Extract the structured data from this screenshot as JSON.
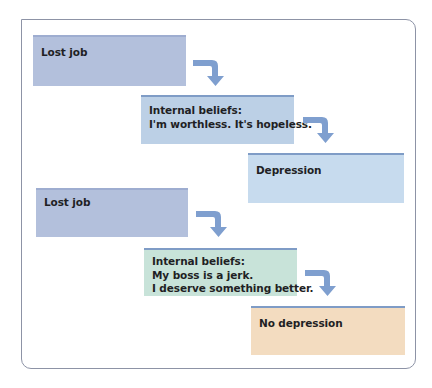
{
  "diagram": {
    "type": "flow",
    "colors": {
      "frame_border": "#8d93a6",
      "event_box": "#b3c0dc",
      "belief_negative_box": "#bcd0e6",
      "depression_box": "#c7dbee",
      "belief_positive_box": "#c8e3d9",
      "no_depression_box": "#f3dcc0",
      "arrow": "#7f9fcf"
    },
    "scenario_1": {
      "event": {
        "label": "Lost job"
      },
      "beliefs": {
        "heading": "Internal beliefs:",
        "lines": [
          "I'm worthless. It's hopeless."
        ]
      },
      "outcome": {
        "label": "Depression"
      }
    },
    "scenario_2": {
      "event": {
        "label": "Lost job"
      },
      "beliefs": {
        "heading": "Internal beliefs:",
        "lines": [
          "My boss is a jerk.",
          "I deserve something better."
        ]
      },
      "outcome": {
        "label": "No depression"
      }
    },
    "arrows": [
      {
        "from": "scenario_1.event",
        "to": "scenario_1.beliefs",
        "icon": "bent-arrow-down-right"
      },
      {
        "from": "scenario_1.beliefs",
        "to": "scenario_1.outcome",
        "icon": "bent-arrow-down-right"
      },
      {
        "from": "scenario_2.event",
        "to": "scenario_2.beliefs",
        "icon": "bent-arrow-down-right"
      },
      {
        "from": "scenario_2.beliefs",
        "to": "scenario_2.outcome",
        "icon": "bent-arrow-down-right"
      }
    ]
  }
}
